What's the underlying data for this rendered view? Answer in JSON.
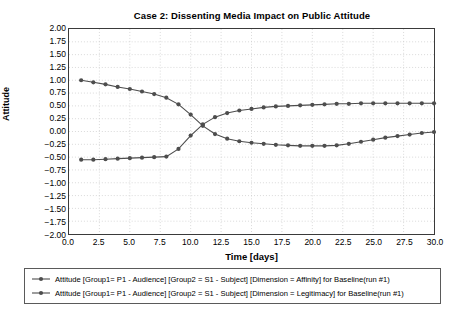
{
  "chart_data": {
    "type": "line",
    "title": "Case 2: Dissenting Media Impact on Public Attitude",
    "xlabel": "Time [days]",
    "ylabel": "Attitude",
    "xlim": [
      0,
      30
    ],
    "ylim": [
      -2.0,
      2.0
    ],
    "grid": true,
    "legend_position": "below",
    "xticks": [
      "0.0",
      "2.5",
      "5.0",
      "7.5",
      "10.0",
      "12.5",
      "15.0",
      "17.5",
      "20.0",
      "22.5",
      "25.0",
      "27.5",
      "30.0"
    ],
    "xtick_values": [
      0.0,
      2.5,
      5.0,
      7.5,
      10.0,
      12.5,
      15.0,
      17.5,
      20.0,
      22.5,
      25.0,
      27.5,
      30.0
    ],
    "yticks": [
      "2.00",
      "1.75",
      "1.50",
      "1.25",
      "1.00",
      "0.75",
      "0.50",
      "0.25",
      "0.00",
      "-0.25",
      "-0.50",
      "-0.75",
      "-1.00",
      "-1.25",
      "-1.50",
      "-1.75",
      "-2.00"
    ],
    "ytick_values": [
      2.0,
      1.75,
      1.5,
      1.25,
      1.0,
      0.75,
      0.5,
      0.25,
      0.0,
      -0.25,
      -0.5,
      -0.75,
      -1.0,
      -1.25,
      -1.5,
      -1.75,
      -2.0
    ],
    "x": [
      1,
      2,
      3,
      4,
      5,
      6,
      7,
      8,
      9,
      10,
      11,
      12,
      13,
      14,
      15,
      16,
      17,
      18,
      19,
      20,
      21,
      22,
      23,
      24,
      25,
      26,
      27,
      28,
      29,
      30
    ],
    "series": [
      {
        "name": "Attitude [Group1= P1 - Audience] [Group2 = S1 - Subject] [Dimension = Affinity] for Baseline(run #1)",
        "color": "#4d4d4d",
        "marker": "circle",
        "values": [
          1.0,
          0.96,
          0.92,
          0.87,
          0.83,
          0.78,
          0.73,
          0.66,
          0.53,
          0.33,
          0.11,
          -0.05,
          -0.14,
          -0.19,
          -0.22,
          -0.24,
          -0.26,
          -0.27,
          -0.28,
          -0.28,
          -0.28,
          -0.27,
          -0.24,
          -0.2,
          -0.16,
          -0.12,
          -0.09,
          -0.06,
          -0.03,
          -0.01
        ]
      },
      {
        "name": "Attitude [Group1= P1 - Audience] [Group2 = S1 - Subject] [Dimension = Legitimacy] for Baseline(run #1)",
        "color": "#4d4d4d",
        "marker": "circle",
        "values": [
          -0.55,
          -0.55,
          -0.54,
          -0.53,
          -0.52,
          -0.51,
          -0.5,
          -0.49,
          -0.34,
          -0.08,
          0.14,
          0.28,
          0.36,
          0.41,
          0.44,
          0.47,
          0.49,
          0.5,
          0.51,
          0.52,
          0.53,
          0.54,
          0.54,
          0.55,
          0.55,
          0.55,
          0.55,
          0.55,
          0.55,
          0.55
        ]
      }
    ]
  },
  "legend": {
    "entries": [
      "Attitude [Group1= P1 - Audience] [Group2 = S1 - Subject] [Dimension = Affinity] for Baseline(run #1)",
      "Attitude [Group1= P1 - Audience] [Group2 = S1 - Subject] [Dimension = Legitimacy] for Baseline(run #1)"
    ]
  }
}
